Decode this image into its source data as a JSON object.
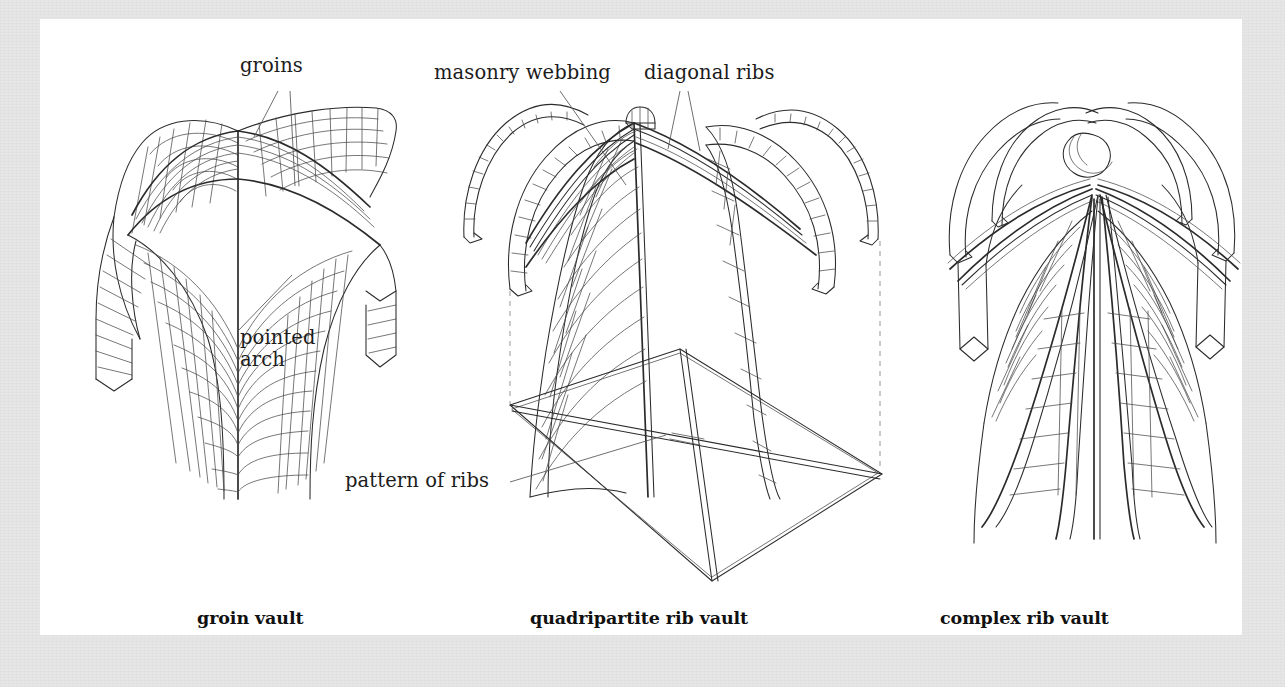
{
  "figure": {
    "kind": "architectural-line-diagram",
    "frame_color": "#e6e6e6",
    "panel_color": "#ffffff",
    "ink_color": "#2b2b2b"
  },
  "labels": {
    "groins": "groins",
    "pointed_arch": "pointed\narch",
    "masonry_webbing": "masonry webbing",
    "diagonal_ribs": "diagonal ribs",
    "pattern_of_ribs": "pattern of ribs"
  },
  "captions": {
    "groin_vault": "groin vault",
    "quadripartite_rib_vault": "quadripartite rib vault",
    "complex_rib_vault": "complex rib vault"
  },
  "panels": [
    {
      "id": "groin-vault",
      "caption": "groin vault",
      "callouts": [
        "groins",
        "pointed arch"
      ],
      "features": [
        "masonry coursing",
        "groin intersections",
        "pointed arch profile"
      ]
    },
    {
      "id": "quadripartite-rib-vault",
      "caption": "quadripartite rib vault",
      "callouts": [
        "masonry webbing",
        "diagonal ribs",
        "pattern of ribs"
      ],
      "features": [
        "keystone boss",
        "four diagonal ribs",
        "rib plan diagram",
        "dashed projection lines"
      ]
    },
    {
      "id": "complex-rib-vault",
      "caption": "complex rib vault",
      "callouts": [],
      "features": [
        "multiple tierceron ribs",
        "masonry webbing panels",
        "fan of ribs from springing"
      ]
    }
  ]
}
